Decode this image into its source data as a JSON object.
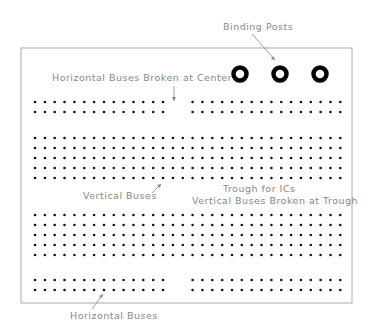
{
  "labels": {
    "binding_posts": "Binding Posts",
    "horizontal_broken": "Horizontal Buses Broken at Center",
    "vertical_buses": "Vertical Buses",
    "trough": "Trough for ICs",
    "vertical_broken": "Vertical Buses Broken at Trough",
    "horizontal_buses": "Horizontal Buses"
  },
  "board": {
    "x": 21,
    "y": 48,
    "width": 331,
    "height": 255
  },
  "posts": [
    {
      "cx": 240,
      "cy": 74
    },
    {
      "cx": 280,
      "cy": 74
    },
    {
      "cx": 320,
      "cy": 74
    }
  ],
  "grid": {
    "col_start": 35,
    "col_step": 9.85,
    "cols": 32,
    "top_bus_rows": [
      102,
      112
    ],
    "upper_rows": [
      138,
      148,
      158,
      168,
      178
    ],
    "lower_rows": [
      215,
      225,
      235,
      245,
      255
    ],
    "bottom_bus_rows": [
      280,
      290
    ],
    "bus_left_cols": 14,
    "bus_gap_after": 14,
    "bus_right_start": 16
  }
}
